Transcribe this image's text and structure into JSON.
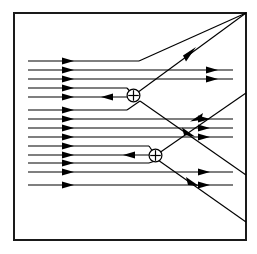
{
  "figure": {
    "kind": "field-line-diagram",
    "background_color": "#ffffff",
    "line_color": "#000000",
    "frame_color": "#1a1a1a",
    "frame": {
      "x": 13,
      "y": 12,
      "width": 233,
      "height": 228,
      "stroke_width": 2
    }
  },
  "charges": [
    {
      "label": "+",
      "symbol": "oplus",
      "name": "upper-positive-charge",
      "cx": 133.5,
      "cy": 95.5,
      "r": 6.2,
      "sign": "positive"
    },
    {
      "label": "+",
      "symbol": "oplus",
      "name": "lower-positive-charge",
      "cx": 155.5,
      "cy": 155.5,
      "r": 6.2,
      "sign": "positive"
    }
  ],
  "incoming_lines": {
    "count": 13,
    "x_start": 28,
    "arrow_x": 68,
    "y_values": [
      61,
      70,
      79,
      88,
      97,
      110,
      119,
      128,
      137,
      146,
      155,
      172,
      185
    ]
  },
  "inward_arrows": [
    {
      "name": "upper-charge-inward-arrow",
      "x": 108,
      "y": 95.5
    },
    {
      "name": "lower-charge-inward-arrow",
      "x": 130,
      "y": 155.5
    }
  ],
  "outgoing_arrows": [
    {
      "name": "outgoing-arrow-top-1",
      "x": 218,
      "y": 70
    },
    {
      "name": "outgoing-arrow-top-2",
      "x": 218,
      "y": 79
    },
    {
      "name": "outgoing-arrow-mid-1",
      "x": 212,
      "y": 118
    },
    {
      "name": "outgoing-arrow-mid-2",
      "x": 212,
      "y": 128
    },
    {
      "name": "outgoing-arrow-mid-3",
      "x": 212,
      "y": 137
    },
    {
      "name": "outgoing-arrow-low-1",
      "x": 212,
      "y": 172
    },
    {
      "name": "outgoing-arrow-low-2",
      "x": 212,
      "y": 185
    }
  ],
  "diagonals": [
    {
      "name": "upper-separatrix",
      "from": [
        133.5,
        95.5
      ],
      "to": [
        246,
        12
      ],
      "arrow_at": [
        190,
        53
      ],
      "direction": "up-right"
    },
    {
      "name": "middle-separatrix",
      "from": [
        246,
        93
      ],
      "to": [
        155.5,
        155.5
      ],
      "arrow_at": [
        196,
        118
      ],
      "direction": "down-left"
    },
    {
      "name": "lower-separatrix",
      "from": [
        155.5,
        155.5
      ],
      "to": [
        246,
        222
      ],
      "arrow_at": [
        196,
        180
      ],
      "direction": "down-right"
    },
    {
      "name": "cross-separatrix",
      "from": [
        133.5,
        95.5
      ],
      "to": [
        246,
        175
      ],
      "arrow_at": [
        192,
        136
      ],
      "direction": "down-right"
    }
  ],
  "stub_lines": [
    {
      "name": "upper-charge-upper-stub",
      "from": [
        28,
        79
      ],
      "to": [
        133.5,
        95.5
      ]
    },
    {
      "name": "upper-charge-lower-stub",
      "from": [
        28,
        110
      ],
      "to": [
        133.5,
        95.5
      ]
    },
    {
      "name": "lower-charge-upper-stub",
      "from": [
        28,
        146
      ],
      "to": [
        155.5,
        155.5
      ]
    },
    {
      "name": "lower-charge-lower-stub",
      "from": [
        28,
        168
      ],
      "to": [
        155.5,
        155.5
      ]
    }
  ]
}
